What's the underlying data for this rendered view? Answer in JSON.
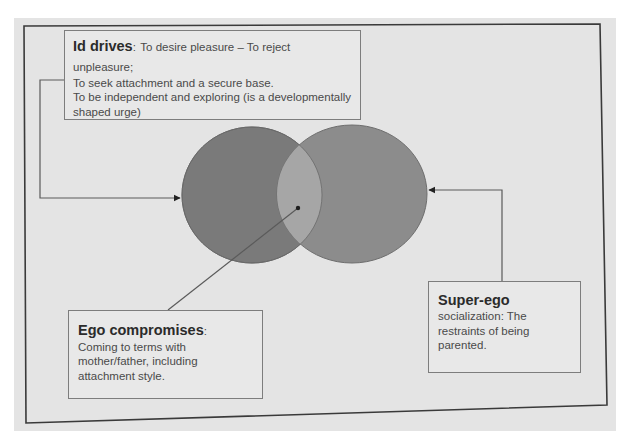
{
  "colors": {
    "sheet": "#e4e4e4",
    "frame": "#3a3a3a",
    "left_circle_fill": "#7a7a7a",
    "right_circle_fill": "#8c8c8c",
    "overlap_fill": "#a6a6a6",
    "connector": "#5a5a5a",
    "box_border": "#7d7d7d"
  },
  "diagram": {
    "id_box": {
      "title": "Id drives",
      "separator": ":",
      "lines": [
        "To desire pleasure – To reject unpleasure;",
        "To seek attachment and a secure base.",
        "To be independent and exploring (is a developmentally",
        "shaped urge)"
      ]
    },
    "ego_box": {
      "title": "Ego compromises",
      "separator": ":",
      "lines": [
        "Coming to terms with",
        "mother/father, including",
        "attachment style."
      ]
    },
    "superego_box": {
      "title": "Super-ego",
      "lines": [
        "socialization: The",
        "restraints of being",
        "parented."
      ]
    },
    "circles": [
      {
        "name": "id-circle",
        "cx": 252,
        "cy": 195,
        "rx": 70,
        "ry": 68
      },
      {
        "name": "superego-circle",
        "cx": 352,
        "cy": 194,
        "rx": 75,
        "ry": 69
      }
    ]
  }
}
